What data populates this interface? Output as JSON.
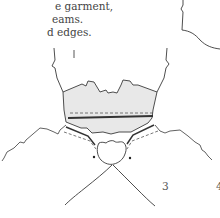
{
  "text": {
    "lines": [
      "e garment,",
      "eams.",
      "d edges."
    ]
  },
  "figure": {
    "colors": {
      "outline": "#3a3a3a",
      "fill": "#e6e6e6",
      "dashed": "#555555"
    }
  },
  "step_labels": {
    "step3": "3",
    "step4": "4"
  }
}
